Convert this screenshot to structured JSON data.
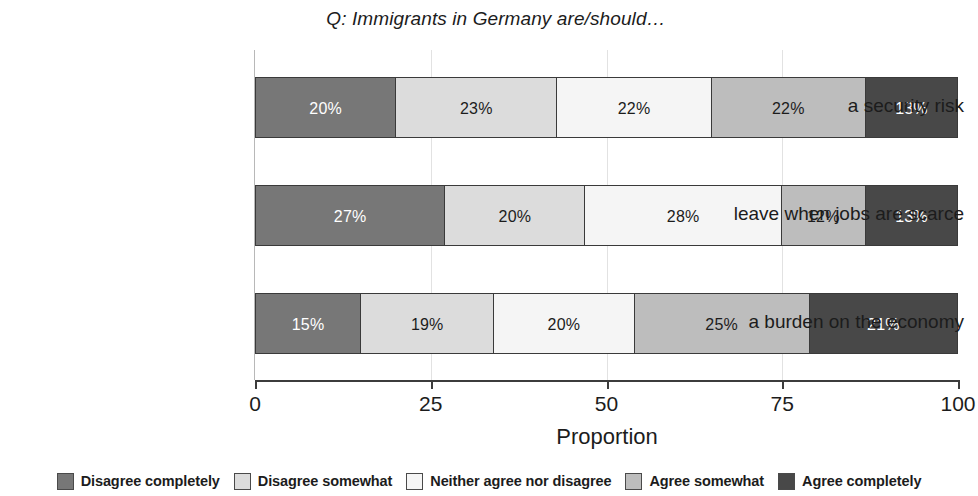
{
  "chart_data": {
    "type": "bar",
    "orientation": "horizontal",
    "stacked": true,
    "percent_stacked": true,
    "title": "Q: Immigrants in Germany are/should…",
    "xlabel": "Proportion",
    "ylabel": "",
    "xlim": [
      0,
      100
    ],
    "xticks": [
      0,
      25,
      50,
      75,
      100
    ],
    "xtick_labels": [
      "0",
      "25",
      "50",
      "75",
      "100"
    ],
    "grid": true,
    "grid_axis": "x",
    "legend_position": "bottom",
    "categories": [
      "a security risk",
      "leave when jobs are scarce",
      "a burden on the economy"
    ],
    "series": [
      {
        "name": "Disagree completely",
        "color": "#777777",
        "text_color": "#ffffff",
        "values": [
          20,
          27,
          15
        ],
        "labels": [
          "20%",
          "27%",
          "15%"
        ]
      },
      {
        "name": "Disagree somewhat",
        "color": "#dcdcdc",
        "text_color": "#1c1c1c",
        "values": [
          23,
          20,
          19
        ],
        "labels": [
          "23%",
          "20%",
          "19%"
        ]
      },
      {
        "name": "Neither agree nor disagree",
        "color": "#f5f5f5",
        "text_color": "#1c1c1c",
        "values": [
          22,
          28,
          20
        ],
        "labels": [
          "22%",
          "28%",
          "20%"
        ]
      },
      {
        "name": "Agree somewhat",
        "color": "#bdbdbd",
        "text_color": "#1c1c1c",
        "values": [
          22,
          12,
          25
        ],
        "labels": [
          "22%",
          "12%",
          "25%"
        ]
      },
      {
        "name": "Agree completely",
        "color": "#484848",
        "text_color": "#ffffff",
        "values": [
          13,
          13,
          21
        ],
        "labels": [
          "13%",
          "13%",
          "21%"
        ]
      }
    ]
  }
}
